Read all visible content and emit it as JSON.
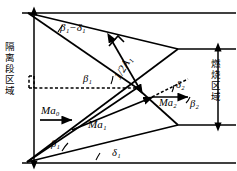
{
  "figure": {
    "type": "schematic-diagram",
    "regions": {
      "left_label": "隔离段区域",
      "right_label": "燃烧区域"
    },
    "labels": {
      "beta1_minus_delta1": "β₁−δ₁",
      "half_A1": "1/2A₁",
      "beta1_mid": "β₁",
      "Ma0": "Ma₀",
      "Ma1": "Ma₁",
      "Ma2": "Ma₂",
      "beta2": "β₂",
      "delta2": "δ₂",
      "beta1_bottom": "β₁",
      "delta1_bottom": "δ₁"
    },
    "colors": {
      "stroke": "#000000",
      "background": "#ffffff"
    }
  }
}
